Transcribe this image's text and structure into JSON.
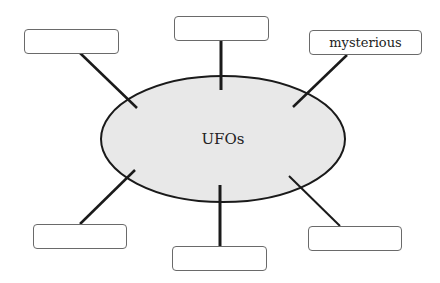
{
  "diagram": {
    "type": "word-web",
    "center": {
      "label": "UFOs",
      "fill": "#e8e8e8",
      "stroke": "#1a1a1a"
    },
    "nodes": [
      {
        "id": "top-left",
        "label": ""
      },
      {
        "id": "top-center",
        "label": ""
      },
      {
        "id": "top-right",
        "label": "mysterious"
      },
      {
        "id": "bottom-left",
        "label": ""
      },
      {
        "id": "bottom-center",
        "label": ""
      },
      {
        "id": "bottom-right",
        "label": ""
      }
    ]
  }
}
